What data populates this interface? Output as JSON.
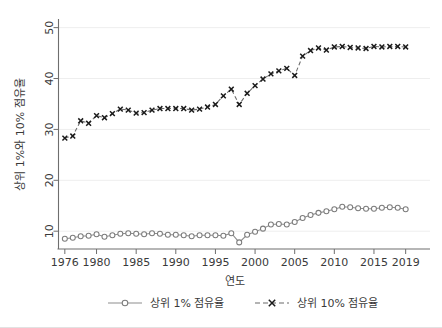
{
  "chart_data": {
    "type": "line",
    "title": "",
    "xlabel": "연도",
    "ylabel": "상위 1%와 10% 점유율",
    "xlim": [
      1975.2,
      2019.8
    ],
    "ylim": [
      6.5,
      51.5
    ],
    "xticks": [
      1976,
      1980,
      1985,
      1990,
      1995,
      2000,
      2005,
      2010,
      2015,
      2019
    ],
    "yticks": [
      10,
      20,
      30,
      40,
      50
    ],
    "xtick_labels": [
      "1976",
      "1980",
      "1985",
      "1990",
      "1995",
      "2000",
      "2005",
      "2010",
      "2015",
      "2019"
    ],
    "ytick_labels": [
      "10",
      "20",
      "30",
      "40",
      "50"
    ],
    "grid": "horizontal",
    "legend_position": "bottom",
    "x": [
      1976,
      1977,
      1978,
      1979,
      1980,
      1981,
      1982,
      1983,
      1984,
      1985,
      1986,
      1987,
      1988,
      1989,
      1990,
      1991,
      1992,
      1993,
      1994,
      1995,
      1996,
      1997,
      1998,
      1999,
      2000,
      2001,
      2002,
      2003,
      2004,
      2005,
      2006,
      2007,
      2008,
      2009,
      2010,
      2011,
      2012,
      2013,
      2014,
      2015,
      2016,
      2017,
      2018,
      2019
    ],
    "series": [
      {
        "name": "상위 1% 점유율",
        "marker": "circle",
        "linestyle": "solid",
        "color": "#8d8d8d",
        "values": [
          8.5,
          8.7,
          9.0,
          9.1,
          9.4,
          8.9,
          9.2,
          9.5,
          9.6,
          9.5,
          9.4,
          9.6,
          9.5,
          9.3,
          9.3,
          9.2,
          9.0,
          9.2,
          9.2,
          9.2,
          9.1,
          9.6,
          7.8,
          9.3,
          9.9,
          10.5,
          11.3,
          11.4,
          11.3,
          11.8,
          12.6,
          13.2,
          13.6,
          13.9,
          14.3,
          14.8,
          14.7,
          14.5,
          14.4,
          14.4,
          14.6,
          14.7,
          14.6,
          14.3
        ]
      },
      {
        "name": "상위 10% 점유율",
        "marker": "x",
        "linestyle": "dashed",
        "color": "#1b1b1b",
        "values": [
          28.3,
          28.7,
          31.7,
          31.2,
          32.7,
          32.3,
          33.1,
          34.0,
          33.8,
          33.2,
          33.3,
          33.8,
          34.1,
          34.1,
          34.1,
          34.1,
          33.8,
          34.0,
          34.4,
          34.9,
          36.6,
          37.9,
          34.9,
          37.1,
          38.6,
          39.9,
          40.9,
          41.5,
          42.0,
          40.6,
          44.4,
          45.5,
          46.0,
          45.6,
          46.2,
          46.3,
          46.1,
          46.0,
          45.9,
          46.3,
          46.2,
          46.3,
          46.3,
          46.2
        ]
      }
    ]
  },
  "legend": {
    "items": [
      {
        "label": "상위 1% 점유율",
        "marker": "circle-marker",
        "style": "solid"
      },
      {
        "label": "상위 10% 점유율",
        "marker": "x-marker",
        "style": "dashed"
      }
    ]
  }
}
